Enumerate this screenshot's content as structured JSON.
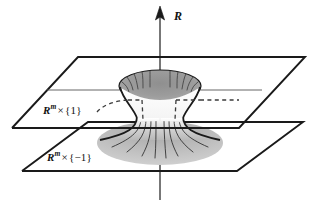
{
  "figure": {
    "kind": "mathematical-diagram",
    "background_color": "#ffffff",
    "ink_color": "#1a1a1a",
    "surface_fill_upper": "#9a9a9a",
    "surface_fill_lower": "#bdbdbd",
    "axis": {
      "name": "vertical-axis",
      "label": "R",
      "arrow_direction": "up"
    },
    "planes": [
      {
        "name": "upper-plane",
        "label_var": "R",
        "label_sup": "m",
        "label_times": "×",
        "label_set": "{1}",
        "label_full": "Rᵐ × {1}"
      },
      {
        "name": "lower-plane",
        "label_var": "R",
        "label_sup": "m",
        "label_times": "×",
        "label_set": "{−1}",
        "label_full": "Rᵐ × {−1}"
      }
    ],
    "surfaces": [
      {
        "name": "upper-funnel",
        "shape": "downward-tapering funnel with elliptical shaded mouth"
      },
      {
        "name": "lower-bell",
        "shape": "downward-flaring bell with elliptical shaded skirt"
      }
    ],
    "guides": {
      "name": "hidden-outline",
      "style": "dashed"
    }
  }
}
